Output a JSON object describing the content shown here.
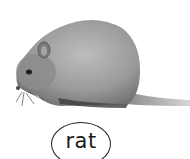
{
  "card": {
    "subject": "rat",
    "label": "rat",
    "image_style": "grayscale photograph"
  },
  "colors": {
    "background": "#ffffff",
    "fur_light": "#b8b8b8",
    "fur_mid": "#8e8e8e",
    "fur_dark": "#4a4a4a",
    "outline": "#222222"
  }
}
